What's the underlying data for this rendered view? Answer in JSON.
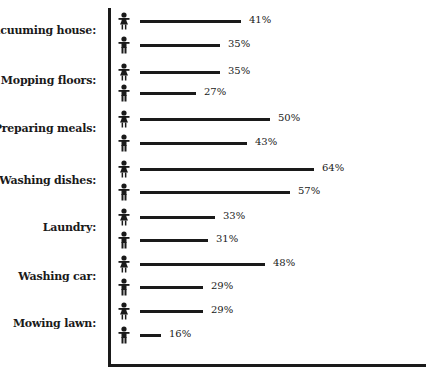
{
  "chart_data": {
    "type": "bar",
    "orientation": "horizontal",
    "title": "",
    "xlabel": "",
    "ylabel": "",
    "grid": false,
    "legend": "icons: girl (skirt) = first bar, boy (pants) = second bar",
    "categories": [
      "Vacuuming house:",
      "Mopping floors:",
      "Preparing meals:",
      "Washing dishes:",
      "Laundry:",
      "Washing car:",
      "Mowing lawn:"
    ],
    "series": [
      {
        "name": "Girls",
        "icon": "girl-icon",
        "values": [
          41,
          35,
          50,
          64,
          33,
          48,
          29
        ]
      },
      {
        "name": "Boys",
        "icon": "boy-icon",
        "values": [
          35,
          27,
          43,
          57,
          31,
          29,
          16
        ]
      }
    ],
    "value_suffix": "%",
    "xlim": [
      0,
      70
    ]
  },
  "colors": {
    "ink": "#1a1a1a",
    "background": "#ffffff"
  },
  "labels": [
    {
      "text": "Vacuuming house:",
      "y": 30
    },
    {
      "text": "Mopping floors:",
      "y": 80
    },
    {
      "text": "Preparing meals:",
      "y": 128
    },
    {
      "text": "Washing dishes:",
      "y": 180
    },
    {
      "text": "Laundry:",
      "y": 227
    },
    {
      "text": "Washing car:",
      "y": 276
    },
    {
      "text": "Mowing lawn:",
      "y": 323
    }
  ],
  "rows": [
    {
      "icon": "girl",
      "value": 41,
      "text": "41%",
      "y": 21,
      "len": 101
    },
    {
      "icon": "boy",
      "value": 35,
      "text": "35%",
      "y": 45,
      "len": 80
    },
    {
      "icon": "girl",
      "value": 35,
      "text": "35%",
      "y": 72,
      "len": 80
    },
    {
      "icon": "boy",
      "value": 27,
      "text": "27%",
      "y": 93,
      "len": 56
    },
    {
      "icon": "girl",
      "value": 50,
      "text": "50%",
      "y": 119,
      "len": 130
    },
    {
      "icon": "boy",
      "value": 43,
      "text": "43%",
      "y": 143,
      "len": 107
    },
    {
      "icon": "girl",
      "value": 64,
      "text": "64%",
      "y": 169,
      "len": 174
    },
    {
      "icon": "boy",
      "value": 57,
      "text": "57%",
      "y": 192,
      "len": 150
    },
    {
      "icon": "girl",
      "value": 33,
      "text": "33%",
      "y": 217,
      "len": 75
    },
    {
      "icon": "boy",
      "value": 31,
      "text": "31%",
      "y": 240,
      "len": 68
    },
    {
      "icon": "girl",
      "value": 48,
      "text": "48%",
      "y": 264,
      "len": 125
    },
    {
      "icon": "boy",
      "value": 29,
      "text": "29%",
      "y": 287,
      "len": 63
    },
    {
      "icon": "girl",
      "value": 29,
      "text": "29%",
      "y": 311,
      "len": 63
    },
    {
      "icon": "boy",
      "value": 16,
      "text": "16%",
      "y": 335,
      "len": 21
    }
  ]
}
